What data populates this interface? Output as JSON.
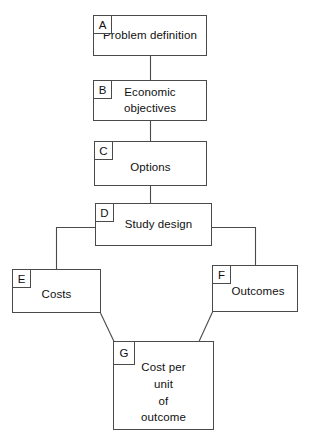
{
  "diagram": {
    "type": "flowchart",
    "background_color": "#ffffff",
    "line_color": "#4a4a4a",
    "text_color": "#101010",
    "nodes": [
      {
        "id": "A",
        "tag": "A",
        "label": "Problem definition"
      },
      {
        "id": "B",
        "tag": "B",
        "label": "Economic objectives"
      },
      {
        "id": "C",
        "tag": "C",
        "label": "Options"
      },
      {
        "id": "D",
        "tag": "D",
        "label": "Study design"
      },
      {
        "id": "E",
        "tag": "E",
        "label": "Costs"
      },
      {
        "id": "F",
        "tag": "F",
        "label": "Outcomes"
      },
      {
        "id": "G",
        "tag": "G",
        "label": "Cost per\nunit\nof\noutcome"
      }
    ],
    "edges": [
      {
        "from": "A",
        "to": "B",
        "style": "vertical"
      },
      {
        "from": "B",
        "to": "C",
        "style": "vertical"
      },
      {
        "from": "C",
        "to": "D",
        "style": "vertical"
      },
      {
        "from": "D",
        "to": "E",
        "style": "elbow-left"
      },
      {
        "from": "D",
        "to": "F",
        "style": "elbow-right"
      },
      {
        "from": "E",
        "to": "G",
        "style": "diagonal"
      },
      {
        "from": "F",
        "to": "G",
        "style": "diagonal"
      }
    ]
  }
}
